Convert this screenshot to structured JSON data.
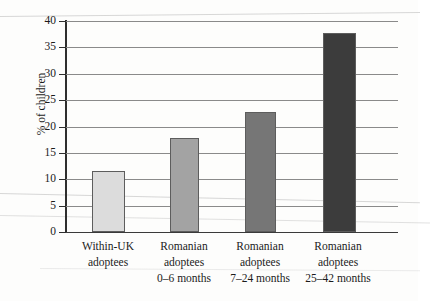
{
  "figure": {
    "ylabel": "% of children"
  },
  "chart_data": {
    "type": "bar",
    "title": "",
    "subtitle": "",
    "xlabel": "",
    "ylabel": "% of children",
    "ylim": [
      0,
      40
    ],
    "yticks": [
      0,
      5,
      10,
      15,
      20,
      25,
      30,
      35,
      40
    ],
    "ytick_labels": [
      "0",
      "5",
      "10",
      "15",
      "20",
      "25",
      "30",
      "35",
      "40"
    ],
    "grid": true,
    "legend": "none",
    "categories": [
      "Within-UK adoptees",
      "Romanian adoptees 0–6 months",
      "Romanian adoptees 7–24 months",
      "Romanian adoptees 25–42 months"
    ],
    "values": [
      11.6,
      17.9,
      22.8,
      37.8
    ],
    "bar_colors": [
      "#dcdcdc",
      "#a3a3a3",
      "#767676",
      "#3c3c3c"
    ],
    "bars": [
      {
        "line1": "Within-UK",
        "line2": "adoptees",
        "line3": "",
        "value": 11.6,
        "color": "#dcdcdc"
      },
      {
        "line1": "Romanian",
        "line2": "adoptees",
        "line3": "0–6 months",
        "value": 17.9,
        "color": "#a3a3a3"
      },
      {
        "line1": "Romanian",
        "line2": "adoptees",
        "line3": "7–24 months",
        "value": 22.8,
        "color": "#767676"
      },
      {
        "line1": "Romanian",
        "line2": "adoptees",
        "line3": "25–42 months",
        "value": 37.8,
        "color": "#3c3c3c"
      }
    ]
  }
}
